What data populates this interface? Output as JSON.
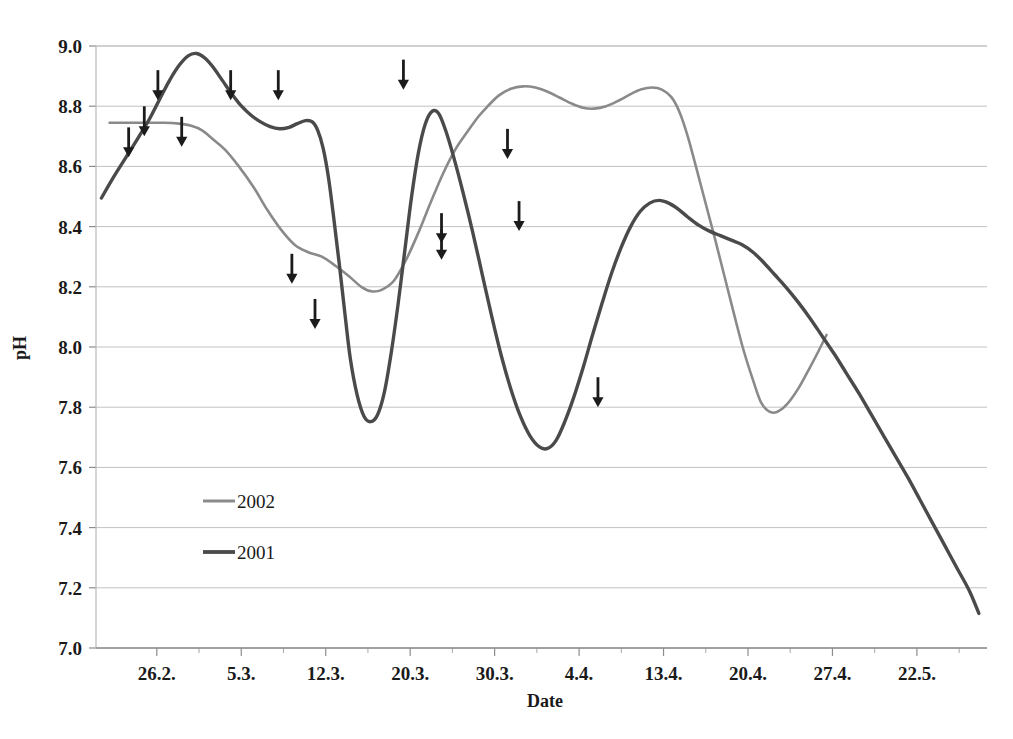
{
  "chart_data": {
    "type": "line",
    "title": "",
    "xlabel": "Date",
    "ylabel": "pH",
    "ylim": [
      7.0,
      9.0
    ],
    "ytick_labels": [
      "9.0",
      "8.8",
      "8.6",
      "8.4",
      "8.2",
      "8.0",
      "7.8",
      "7.6",
      "7.4",
      "7.2",
      "7.0"
    ],
    "ytick_values": [
      9.0,
      8.8,
      8.6,
      8.4,
      8.2,
      8.0,
      7.8,
      7.6,
      7.4,
      7.2,
      7.0
    ],
    "xtick_labels": [
      "26.2.",
      "5.3.",
      "12.3.",
      "20.3.",
      "30.3.",
      "4.4.",
      "13.4.",
      "20.4.",
      "27.4.",
      "22.5."
    ],
    "grid": "horizontal",
    "legend_position": "inside-lower-left",
    "series": [
      {
        "name": "2002",
        "color": "#8a8a8a",
        "width": 2.6,
        "points": [
          [
            160,
            8.745
          ],
          [
            200,
            8.745
          ],
          [
            240,
            8.745
          ],
          [
            262,
            8.742
          ],
          [
            280,
            8.735
          ],
          [
            296,
            8.72
          ],
          [
            312,
            8.69
          ],
          [
            330,
            8.655
          ],
          [
            350,
            8.6
          ],
          [
            372,
            8.53
          ],
          [
            392,
            8.455
          ],
          [
            412,
            8.39
          ],
          [
            432,
            8.34
          ],
          [
            452,
            8.315
          ],
          [
            472,
            8.3
          ],
          [
            492,
            8.27
          ],
          [
            512,
            8.235
          ],
          [
            530,
            8.2
          ],
          [
            545,
            8.185
          ],
          [
            560,
            8.19
          ],
          [
            578,
            8.22
          ],
          [
            596,
            8.29
          ],
          [
            614,
            8.38
          ],
          [
            632,
            8.48
          ],
          [
            650,
            8.575
          ],
          [
            668,
            8.655
          ],
          [
            686,
            8.715
          ],
          [
            702,
            8.765
          ],
          [
            716,
            8.8
          ],
          [
            732,
            8.835
          ],
          [
            750,
            8.858
          ],
          [
            768,
            8.866
          ],
          [
            786,
            8.862
          ],
          [
            804,
            8.848
          ],
          [
            822,
            8.828
          ],
          [
            840,
            8.808
          ],
          [
            856,
            8.795
          ],
          [
            872,
            8.792
          ],
          [
            890,
            8.8
          ],
          [
            908,
            8.818
          ],
          [
            926,
            8.84
          ],
          [
            942,
            8.856
          ],
          [
            958,
            8.862
          ],
          [
            972,
            8.855
          ],
          [
            986,
            8.83
          ],
          [
            998,
            8.78
          ],
          [
            1010,
            8.7
          ],
          [
            1022,
            8.6
          ],
          [
            1036,
            8.48
          ],
          [
            1050,
            8.36
          ],
          [
            1064,
            8.235
          ],
          [
            1078,
            8.11
          ],
          [
            1092,
            7.99
          ],
          [
            1106,
            7.89
          ],
          [
            1118,
            7.815
          ],
          [
            1130,
            7.785
          ],
          [
            1142,
            7.785
          ],
          [
            1156,
            7.81
          ],
          [
            1172,
            7.86
          ],
          [
            1188,
            7.925
          ],
          [
            1202,
            7.985
          ],
          [
            1214,
            8.04
          ]
        ]
      },
      {
        "name": "2001",
        "color": "#4a4a4a",
        "width": 3.4,
        "points": [
          [
            148,
            8.495
          ],
          [
            166,
            8.565
          ],
          [
            184,
            8.63
          ],
          [
            202,
            8.695
          ],
          [
            218,
            8.755
          ],
          [
            234,
            8.825
          ],
          [
            248,
            8.885
          ],
          [
            262,
            8.935
          ],
          [
            276,
            8.968
          ],
          [
            288,
            8.975
          ],
          [
            300,
            8.96
          ],
          [
            312,
            8.93
          ],
          [
            326,
            8.885
          ],
          [
            340,
            8.84
          ],
          [
            354,
            8.8
          ],
          [
            368,
            8.77
          ],
          [
            382,
            8.748
          ],
          [
            396,
            8.732
          ],
          [
            410,
            8.725
          ],
          [
            424,
            8.73
          ],
          [
            436,
            8.742
          ],
          [
            448,
            8.752
          ],
          [
            458,
            8.748
          ],
          [
            466,
            8.72
          ],
          [
            474,
            8.66
          ],
          [
            482,
            8.56
          ],
          [
            490,
            8.42
          ],
          [
            498,
            8.27
          ],
          [
            506,
            8.11
          ],
          [
            514,
            7.96
          ],
          [
            524,
            7.84
          ],
          [
            534,
            7.77
          ],
          [
            544,
            7.752
          ],
          [
            554,
            7.775
          ],
          [
            564,
            7.85
          ],
          [
            574,
            7.98
          ],
          [
            584,
            8.14
          ],
          [
            594,
            8.32
          ],
          [
            604,
            8.5
          ],
          [
            614,
            8.645
          ],
          [
            624,
            8.74
          ],
          [
            634,
            8.783
          ],
          [
            644,
            8.775
          ],
          [
            654,
            8.72
          ],
          [
            666,
            8.63
          ],
          [
            680,
            8.51
          ],
          [
            694,
            8.38
          ],
          [
            708,
            8.24
          ],
          [
            722,
            8.1
          ],
          [
            736,
            7.97
          ],
          [
            750,
            7.86
          ],
          [
            764,
            7.77
          ],
          [
            778,
            7.705
          ],
          [
            792,
            7.668
          ],
          [
            804,
            7.663
          ],
          [
            816,
            7.688
          ],
          [
            828,
            7.745
          ],
          [
            842,
            7.83
          ],
          [
            856,
            7.93
          ],
          [
            870,
            8.04
          ],
          [
            884,
            8.145
          ],
          [
            898,
            8.245
          ],
          [
            912,
            8.33
          ],
          [
            926,
            8.4
          ],
          [
            940,
            8.45
          ],
          [
            954,
            8.478
          ],
          [
            968,
            8.487
          ],
          [
            982,
            8.478
          ],
          [
            996,
            8.458
          ],
          [
            1010,
            8.432
          ],
          [
            1026,
            8.405
          ],
          [
            1042,
            8.385
          ],
          [
            1058,
            8.37
          ],
          [
            1074,
            8.355
          ],
          [
            1090,
            8.34
          ],
          [
            1106,
            8.315
          ],
          [
            1122,
            8.28
          ],
          [
            1138,
            8.24
          ],
          [
            1154,
            8.2
          ],
          [
            1172,
            8.15
          ],
          [
            1190,
            8.095
          ],
          [
            1208,
            8.035
          ],
          [
            1226,
            7.975
          ],
          [
            1244,
            7.91
          ],
          [
            1262,
            7.845
          ],
          [
            1280,
            7.775
          ],
          [
            1298,
            7.705
          ],
          [
            1316,
            7.635
          ],
          [
            1334,
            7.565
          ],
          [
            1352,
            7.49
          ],
          [
            1370,
            7.415
          ],
          [
            1388,
            7.34
          ],
          [
            1406,
            7.265
          ],
          [
            1424,
            7.19
          ],
          [
            1438,
            7.115
          ]
        ]
      }
    ],
    "annotations": {
      "marker": "down-arrow",
      "arrows": [
        [
          188,
          8.63
        ],
        [
          211,
          8.7
        ],
        [
          231,
          8.82
        ],
        [
          266,
          8.665
        ],
        [
          338,
          8.82
        ],
        [
          408,
          8.82
        ],
        [
          428,
          8.21
        ],
        [
          462,
          8.06
        ],
        [
          592,
          8.855
        ],
        [
          648,
          8.345
        ],
        [
          648,
          8.29
        ],
        [
          745,
          8.625
        ],
        [
          762,
          8.385
        ],
        [
          878,
          7.8
        ]
      ]
    }
  },
  "legend": {
    "entries": [
      {
        "label": "2002"
      },
      {
        "label": "2001"
      }
    ]
  }
}
